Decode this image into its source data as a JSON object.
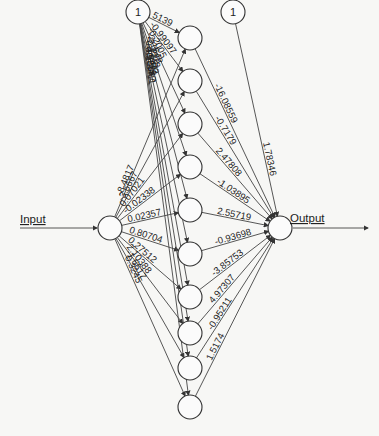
{
  "diagram": {
    "type": "neural-network",
    "input_label": "Input",
    "output_label": "Output",
    "bias_label": "1",
    "colors": {
      "line": "#444444",
      "node_fill": "#fbfbfb",
      "background": "#f7f7f5"
    },
    "layers": {
      "input": [
        {
          "id": "I1",
          "x": 110,
          "y": 228
        }
      ],
      "hidden": [
        {
          "id": "H1",
          "x": 190,
          "y": 38
        },
        {
          "id": "H2",
          "x": 190,
          "y": 81
        },
        {
          "id": "H3",
          "x": 190,
          "y": 124
        },
        {
          "id": "H4",
          "x": 190,
          "y": 167
        },
        {
          "id": "H5",
          "x": 190,
          "y": 210
        },
        {
          "id": "H6",
          "x": 190,
          "y": 254
        },
        {
          "id": "H7",
          "x": 190,
          "y": 297
        },
        {
          "id": "H8",
          "x": 190,
          "y": 333
        },
        {
          "id": "H9",
          "x": 190,
          "y": 368
        },
        {
          "id": "H10",
          "x": 190,
          "y": 407
        }
      ],
      "output": [
        {
          "id": "O1",
          "x": 280,
          "y": 228
        }
      ],
      "bias_hidden": {
        "x": 138,
        "y": 12
      },
      "bias_output": {
        "x": 233,
        "y": 12
      }
    },
    "weights": {
      "bias_to_hidden": [
        "5139",
        "-0.99097",
        "-0.2005",
        "-2.1648",
        "-2.7228",
        "0.27172",
        "-4.6471",
        "0.3225",
        "-0.0547",
        "-1.3411"
      ],
      "input_to_hidden": [
        "-8.4817",
        "-3.6667",
        "0.07021",
        "-0.02338",
        "0.02357",
        "0.80704",
        "0.27512",
        "2.10388",
        "-1.6617",
        "0.3245"
      ],
      "hidden_to_output": [
        "-16.08559",
        "-0.7179",
        "2.47808",
        "-1.03895",
        "2.55719",
        "-0.93698",
        "-3.85753",
        "4.97307",
        "-0.95211",
        "1.5174"
      ],
      "bias_to_output": "1.78346"
    }
  }
}
